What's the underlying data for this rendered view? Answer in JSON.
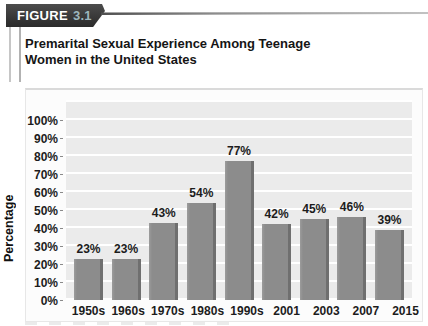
{
  "figure_label": {
    "word": "FIGURE",
    "number": "3.1"
  },
  "title": {
    "line1": "Premarital Sexual Experience Among Teenage",
    "line2": "Women in the United States"
  },
  "colors": {
    "tab_background": "#3a3a3a",
    "tab_word": "#ffffff",
    "tab_number": "#9db6bd",
    "bar": "#8c8c8c",
    "bar_shadow": "#6f6f6f",
    "plot_background": "#ebebeb",
    "gridline": "#ffffff",
    "text": "#1c1c1c"
  },
  "chart_data": {
    "type": "bar",
    "title": "Premarital Sexual Experience Among Teenage Women in the United States",
    "categories": [
      "1950s",
      "1960s",
      "1970s",
      "1980s",
      "1990s",
      "2001",
      "2003",
      "2007",
      "2015"
    ],
    "values": [
      23,
      23,
      43,
      54,
      77,
      42,
      45,
      46,
      39
    ],
    "value_labels": [
      "23%",
      "23%",
      "43%",
      "54%",
      "77%",
      "42%",
      "45%",
      "46%",
      "39%"
    ],
    "xlabel": "",
    "ylabel": "Percentage",
    "ylim": [
      0,
      100
    ],
    "y_ticks": [
      "0%",
      "10%",
      "20%",
      "30%",
      "40%",
      "50%",
      "60%",
      "70%",
      "80%",
      "90%",
      "100%"
    ],
    "grid": "horizontal",
    "legend": "none",
    "bar_color": "#8c8c8c"
  }
}
